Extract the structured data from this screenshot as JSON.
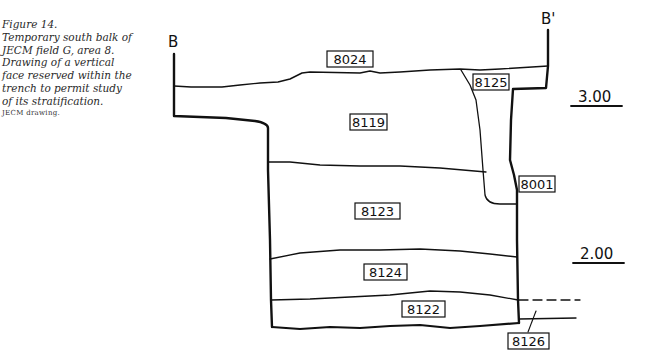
{
  "caption": {
    "lines": [
      "Figure 14.",
      "Temporary south balk of",
      "JECM field G, area 8.",
      "Drawing of a vertical",
      "face reserved within the",
      "trench to permit study",
      "of its stratification."
    ],
    "credit": "JECM drawing."
  },
  "section": {
    "left_marker": "B",
    "right_marker": "B'"
  },
  "layers": [
    {
      "id": "8024"
    },
    {
      "id": "8125"
    },
    {
      "id": "8119"
    },
    {
      "id": "8001"
    },
    {
      "id": "8123"
    },
    {
      "id": "8124"
    },
    {
      "id": "8122"
    },
    {
      "id": "8126"
    }
  ],
  "elevations": [
    {
      "label": "3.00"
    },
    {
      "label": "2.00"
    }
  ]
}
